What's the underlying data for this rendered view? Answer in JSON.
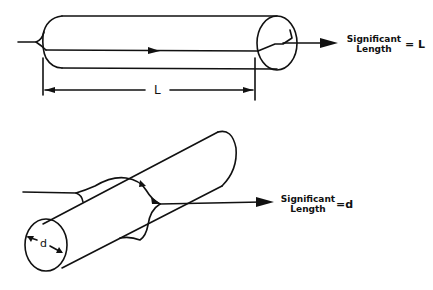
{
  "top_figure": {
    "label_line1": "Significant",
    "label_line2": "Length",
    "equals": "= L",
    "dimension": "L"
  },
  "bottom_figure": {
    "label_line1": "Significant",
    "label_line2": "Length",
    "equals": "=d",
    "dimension": "d"
  }
}
